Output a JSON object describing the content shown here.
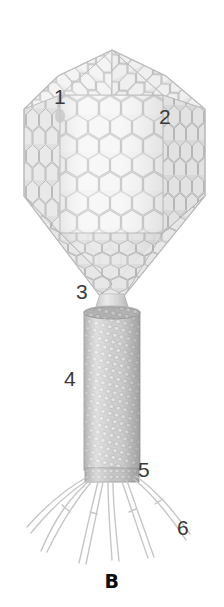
{
  "figure": {
    "panel_letter": "B",
    "title_visible": false,
    "background_color": "#ffffff",
    "ink_color": "#3a3a3a",
    "panel_letter_color": "#0d0d0d",
    "palette": {
      "capsid_fill": "#f2f2f2",
      "capsid_line": "#c9c9c9",
      "capsid_shade_left": "#dcdcdc",
      "capsid_shade_right": "#d2d2d2",
      "sheath_fill": "#c6c6c6",
      "sheath_light": "#e2e2e2",
      "sheath_dark": "#a9a9a9",
      "fiber_line": "#c4c4c4",
      "baseplate_fill": "#bdbdbd"
    }
  },
  "callouts": [
    {
      "id": "1",
      "label": "1",
      "refers_to": "capsid-head-upper-facet"
    },
    {
      "id": "2",
      "label": "2",
      "refers_to": "capsid-head-right-facet"
    },
    {
      "id": "3",
      "label": "3",
      "refers_to": "neck-collar"
    },
    {
      "id": "4",
      "label": "4",
      "refers_to": "tail-sheath"
    },
    {
      "id": "5",
      "label": "5",
      "refers_to": "baseplate"
    },
    {
      "id": "6",
      "label": "6",
      "refers_to": "tail-fiber"
    }
  ]
}
